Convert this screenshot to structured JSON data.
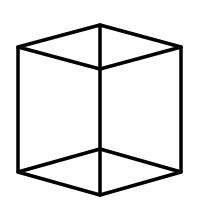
{
  "diagram": {
    "type": "wireframe-cube",
    "stroke_color": "#000000",
    "background": "#ffffff",
    "stroke_width": 3.5,
    "vertices": {
      "top_back": [
        100,
        25
      ],
      "top_left": [
        18,
        47
      ],
      "top_right": [
        181,
        47
      ],
      "top_front": [
        100,
        69
      ],
      "bottom_back": [
        100,
        149
      ],
      "bottom_left": [
        18,
        172
      ],
      "bottom_right": [
        181,
        172
      ],
      "bottom_front": [
        100,
        195
      ]
    }
  }
}
